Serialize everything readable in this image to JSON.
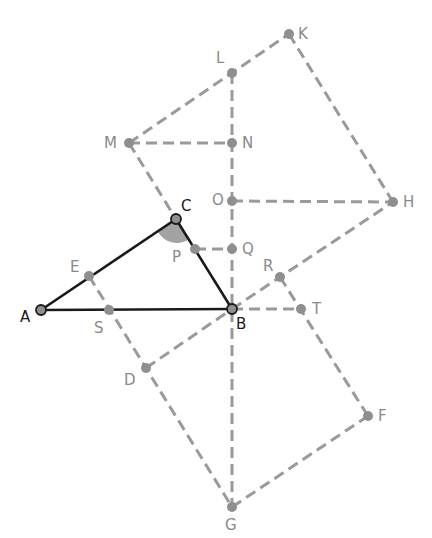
{
  "diagram": {
    "title_cut_off": "",
    "colors": {
      "construction_line": "#9a9a9a",
      "triangle_line": "#1a1a1a",
      "point_fill": "#8f8f8f",
      "angle_fill": "#a3a3a3",
      "label_gray": "#8a8a8a",
      "label_dark": "#1a1a1a"
    },
    "points": {
      "A": {
        "label": "A",
        "x": 41,
        "y": 310
      },
      "B": {
        "label": "B",
        "x": 232,
        "y": 309
      },
      "C": {
        "label": "C",
        "x": 176,
        "y": 219
      },
      "D": {
        "label": "D",
        "x": 146,
        "y": 368
      },
      "E": {
        "label": "E",
        "x": 89,
        "y": 276
      },
      "F": {
        "label": "F",
        "x": 368,
        "y": 416
      },
      "G": {
        "label": "G",
        "x": 232,
        "y": 507
      },
      "H": {
        "label": "H",
        "x": 393,
        "y": 202
      },
      "K": {
        "label": "K",
        "x": 289,
        "y": 34
      },
      "L": {
        "label": "L",
        "x": 232,
        "y": 73
      },
      "M": {
        "label": "M",
        "x": 129,
        "y": 143
      },
      "N": {
        "label": "N",
        "x": 232,
        "y": 143
      },
      "O": {
        "label": "O",
        "x": 232,
        "y": 201
      },
      "P": {
        "label": "P",
        "x": 195,
        "y": 249
      },
      "Q": {
        "label": "Q",
        "x": 232,
        "y": 249
      },
      "R": {
        "label": "R",
        "x": 280,
        "y": 277
      },
      "S": {
        "label": "S",
        "x": 109,
        "y": 310
      },
      "T": {
        "label": "T",
        "x": 301,
        "y": 309
      }
    },
    "solid_segments": [
      [
        "A",
        "B"
      ],
      [
        "A",
        "C"
      ],
      [
        "C",
        "B"
      ]
    ],
    "dashed_segments": [
      [
        "M",
        "K"
      ],
      [
        "K",
        "H"
      ],
      [
        "L",
        "G"
      ],
      [
        "M",
        "N"
      ],
      [
        "O",
        "H"
      ],
      [
        "P",
        "Q"
      ],
      [
        "M",
        "G"
      ],
      [
        "D",
        "B"
      ],
      [
        "B",
        "H"
      ],
      [
        "R",
        "F"
      ],
      [
        "B",
        "T"
      ],
      [
        "G",
        "F"
      ]
    ],
    "shaded_angle": "C"
  }
}
